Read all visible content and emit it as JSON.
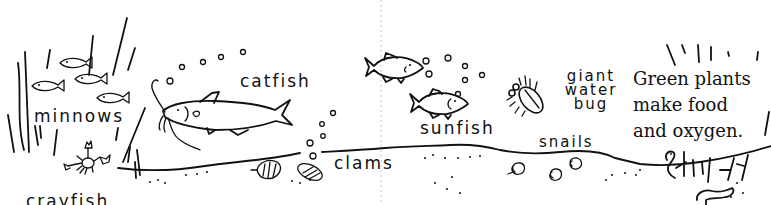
{
  "diagram": {
    "labels": {
      "minnows": "minnows",
      "catfish": "catfish",
      "crayfish": "crayfish",
      "clams": "clams",
      "sunfish": "sunfish",
      "giant_water_bug": "giant\nwater\nbug",
      "snails": "snails"
    },
    "caption": "Green plants\nmake food\nand oxygen.",
    "organisms": [
      "minnows",
      "catfish",
      "crayfish",
      "clams",
      "sunfish",
      "giant water bug",
      "snails",
      "worms",
      "green plants"
    ],
    "colors": {
      "ink": "#111111",
      "background": "#ffffff",
      "fold_line": "#c8c8c8"
    }
  }
}
